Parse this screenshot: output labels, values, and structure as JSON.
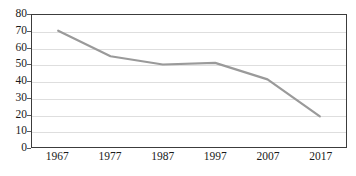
{
  "chart_data": {
    "type": "line",
    "title": "",
    "xlabel": "",
    "ylabel": "",
    "categories": [
      "1967",
      "1977",
      "1987",
      "1997",
      "2007",
      "2017"
    ],
    "x": [
      1967,
      1977,
      1987,
      1997,
      2007,
      2017
    ],
    "series": [
      {
        "name": "series-1",
        "color": "#9a9a9a",
        "values": [
          70.5,
          55.0,
          50.0,
          51.0,
          41.0,
          18.5
        ]
      }
    ],
    "values": [
      70.5,
      55.0,
      50.0,
      51.0,
      41.0,
      18.5
    ],
    "ylim": [
      0,
      80
    ],
    "xlim": [
      1962,
      2022
    ],
    "yticks": [
      "0",
      "10",
      "20",
      "30",
      "40",
      "50",
      "60",
      "70",
      "80"
    ],
    "ytick_values": [
      0,
      10,
      20,
      30,
      40,
      50,
      60,
      70,
      80
    ],
    "xticks": [
      "1967",
      "1977",
      "1987",
      "1997",
      "2007",
      "2017"
    ],
    "grid": "horizontal",
    "legend": "none",
    "markers": "none",
    "line_color": "#9a9a9a",
    "grid_color": "#dedede",
    "frame_color": "#3c3c3c",
    "background": "#ffffff",
    "title_remnant": ""
  }
}
